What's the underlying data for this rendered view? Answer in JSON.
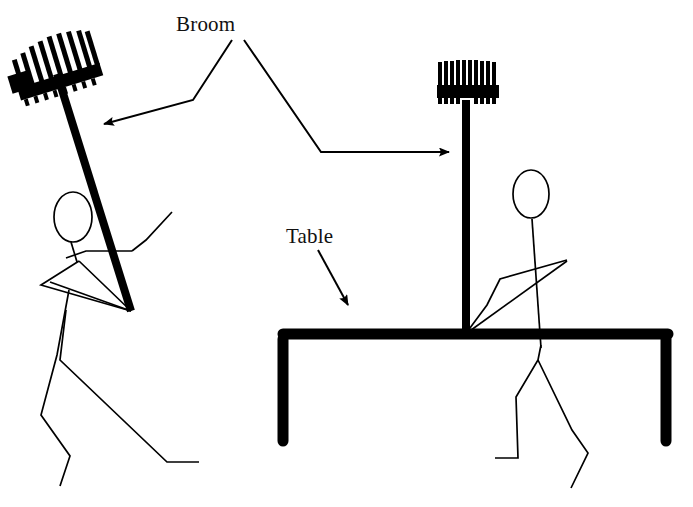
{
  "canvas": {
    "width": 693,
    "height": 507,
    "background_color": "#ffffff",
    "ink_color": "#000000"
  },
  "labels": {
    "broom": "Broom",
    "table": "Table"
  },
  "annotations": [
    {
      "name": "broom-to-left-broom",
      "label": "Broom",
      "points": "232,40 193,100 104,124",
      "arrowhead_at": "end"
    },
    {
      "name": "broom-to-right-broom",
      "label": "Broom",
      "points": "244,40 321,152 456,152",
      "arrowhead_at": "end"
    },
    {
      "name": "table-to-tabletop",
      "label": "Table",
      "points": "318,250 352,310",
      "arrowhead_at": "end"
    }
  ],
  "scene": {
    "left_figure": {
      "name": "stick-figure-balancing-broom",
      "description": "Stick figure leaning, balancing a broom on outstretched hands",
      "head": {
        "cx": 73,
        "cy": 217,
        "rx": 19,
        "ry": 25
      },
      "broom": {
        "handle": {
          "x1": 131,
          "y1": 311,
          "x2": 58,
          "y2": 72
        },
        "head_angle_deg": -17,
        "bristle_count": 9
      }
    },
    "right_figure": {
      "name": "stick-figure-broom-on-table",
      "description": "Stick figure standing behind a table with a broom resting vertically on the tabletop",
      "head": {
        "cx": 531,
        "cy": 194,
        "rx": 18,
        "ry": 24
      },
      "broom": {
        "handle": {
          "x1": 466,
          "y1": 100,
          "x2": 466,
          "y2": 333
        },
        "head_angle_deg": 0,
        "bristle_count": 11
      }
    },
    "table": {
      "name": "table",
      "top": {
        "x1": 283,
        "y1": 334,
        "x2": 668,
        "y2": 334
      },
      "left_leg": {
        "x": 283,
        "y1": 334,
        "y2": 443
      },
      "right_leg": {
        "x": 666,
        "y1": 334,
        "y2": 443
      },
      "stroke_width": 11
    }
  }
}
